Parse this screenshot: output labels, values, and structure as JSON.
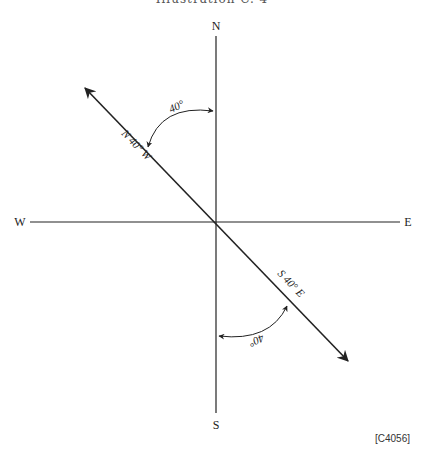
{
  "header": {
    "title": "Illustration C. 4"
  },
  "compass": {
    "north": "N",
    "south": "S",
    "east": "E",
    "west": "W"
  },
  "bearings": [
    {
      "label": "N 40° W",
      "angle_label": "40°"
    },
    {
      "label": "S 40° E",
      "angle_label": "40°"
    }
  ],
  "reference": "[C4056]",
  "colors": {
    "line": "#222222",
    "background": "#ffffff"
  }
}
